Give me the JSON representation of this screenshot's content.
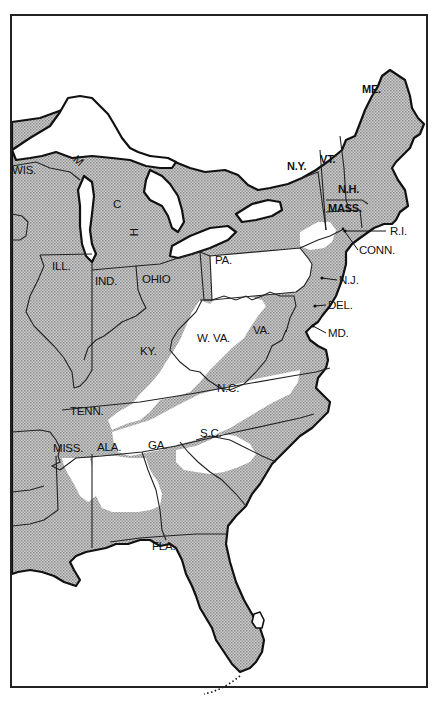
{
  "map": {
    "title": "",
    "shading": {
      "shaded_fill": "#b9b9b9",
      "unshaded_fill": "#ffffff",
      "border_color": "#111111"
    },
    "labels": {
      "wis": "WIS.",
      "mich_m": "M",
      "mich_i": "I",
      "mich_c": "C",
      "mich_h": "H",
      "ill": "ILL.",
      "ind": "IND.",
      "ohio": "OHIO",
      "pa": "PA.",
      "ny": "N.Y.",
      "vt": "VT.",
      "me": "ME.",
      "nh": "N.H.",
      "mass": "MASS.",
      "ri": "R.I.",
      "conn": "CONN.",
      "nj": "N.J.",
      "del": "DEL.",
      "md": "MD.",
      "va": "VA.",
      "wva": "W. VA.",
      "ky": "KY.",
      "tenn": "TENN.",
      "nc": "N.C.",
      "sc": "S.C.",
      "miss": "MISS.",
      "ala": "ALA.",
      "ga": "GA.",
      "fla": "FLA."
    }
  }
}
